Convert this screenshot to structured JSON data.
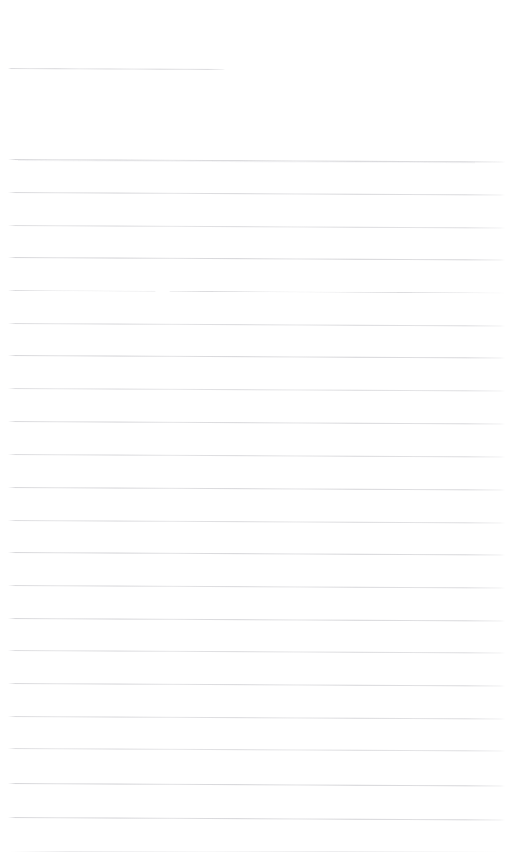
{
  "document": {
    "kind": "scanned-ruled-paper",
    "title_text": "",
    "body_text": "",
    "page_width": 528,
    "page_height": 865,
    "background_color": "#ffffff",
    "rule_color": "#96969e",
    "rule_thickness_px": 1,
    "rule_spacing_px": 32.6,
    "skew_degrees": 0.28,
    "total_rules": 21,
    "content_summary": "Blank lined notebook page with no written text"
  },
  "rules": [
    {
      "name": "title-rule",
      "y": 68,
      "left": 8,
      "right": 225,
      "opacity": 0.62,
      "gapped": false,
      "smudge": false
    },
    {
      "name": "body-rule-1",
      "y": 159,
      "left": 8,
      "right": 505,
      "opacity": 0.7,
      "gapped": false,
      "smudge": true
    },
    {
      "name": "body-rule-2",
      "y": 192,
      "left": 8,
      "right": 505,
      "opacity": 0.66,
      "gapped": false,
      "smudge": false
    },
    {
      "name": "body-rule-3",
      "y": 225,
      "left": 8,
      "right": 505,
      "opacity": 0.6,
      "gapped": false,
      "smudge": false
    },
    {
      "name": "body-rule-4",
      "y": 257,
      "left": 8,
      "right": 505,
      "opacity": 0.72,
      "gapped": false,
      "smudge": false
    },
    {
      "name": "body-rule-5",
      "y": 290,
      "left": 8,
      "right": 505,
      "opacity": 0.68,
      "gapped": true,
      "smudge": false
    },
    {
      "name": "body-rule-6",
      "y": 323,
      "left": 8,
      "right": 505,
      "opacity": 0.62,
      "gapped": false,
      "smudge": false
    },
    {
      "name": "body-rule-7",
      "y": 355,
      "left": 8,
      "right": 505,
      "opacity": 0.7,
      "gapped": false,
      "smudge": false
    },
    {
      "name": "body-rule-8",
      "y": 388,
      "left": 8,
      "right": 505,
      "opacity": 0.58,
      "gapped": false,
      "smudge": false
    },
    {
      "name": "body-rule-9",
      "y": 421,
      "left": 8,
      "right": 505,
      "opacity": 0.66,
      "gapped": false,
      "smudge": false
    },
    {
      "name": "body-rule-10",
      "y": 454,
      "left": 8,
      "right": 505,
      "opacity": 0.62,
      "gapped": false,
      "smudge": false
    },
    {
      "name": "body-rule-11",
      "y": 487,
      "left": 8,
      "right": 505,
      "opacity": 0.68,
      "gapped": false,
      "smudge": false
    },
    {
      "name": "body-rule-12",
      "y": 520,
      "left": 8,
      "right": 505,
      "opacity": 0.6,
      "gapped": false,
      "smudge": false
    },
    {
      "name": "body-rule-13",
      "y": 552,
      "left": 8,
      "right": 505,
      "opacity": 0.7,
      "gapped": false,
      "smudge": false
    },
    {
      "name": "body-rule-14",
      "y": 585,
      "left": 8,
      "right": 505,
      "opacity": 0.64,
      "gapped": false,
      "smudge": false
    },
    {
      "name": "body-rule-15",
      "y": 618,
      "left": 8,
      "right": 505,
      "opacity": 0.68,
      "gapped": false,
      "smudge": false
    },
    {
      "name": "body-rule-16",
      "y": 650,
      "left": 8,
      "right": 505,
      "opacity": 0.6,
      "gapped": false,
      "smudge": false
    },
    {
      "name": "body-rule-17",
      "y": 683,
      "left": 8,
      "right": 505,
      "opacity": 0.66,
      "gapped": false,
      "smudge": false
    },
    {
      "name": "body-rule-18",
      "y": 716,
      "left": 8,
      "right": 505,
      "opacity": 0.62,
      "gapped": false,
      "smudge": false
    },
    {
      "name": "body-rule-19",
      "y": 748,
      "left": 8,
      "right": 505,
      "opacity": 0.58,
      "gapped": false,
      "smudge": false
    },
    {
      "name": "body-rule-20",
      "y": 783,
      "left": 8,
      "right": 505,
      "opacity": 0.72,
      "gapped": false,
      "smudge": false
    },
    {
      "name": "body-rule-21",
      "y": 817,
      "left": 8,
      "right": 505,
      "opacity": 0.7,
      "gapped": false,
      "smudge": false
    }
  ],
  "ghost_traces": [
    {
      "name": "bottom-scan-trace",
      "y": 851,
      "left": 10,
      "right": 500
    }
  ]
}
